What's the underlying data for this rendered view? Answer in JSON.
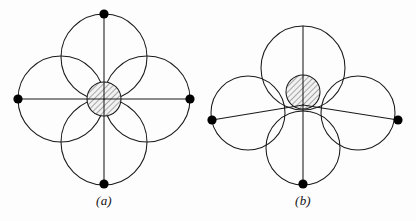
{
  "figure": {
    "background_color": "#fdfdfd",
    "stroke_color": "#1a1a1a",
    "dot_color": "#000000",
    "hatch_color": "#555555",
    "hatch_fill": "#efefef",
    "caption_a": "(a)",
    "caption_b": "(b)"
  },
  "panels": [
    {
      "id": "a",
      "caption": "(a)",
      "center": {
        "x": 104,
        "y": 99
      },
      "center_circle": {
        "cx": 104,
        "cy": 99,
        "r": 17,
        "hatched": true
      },
      "outer_circles": [
        {
          "name": "top-circle",
          "cx": 104,
          "cy": 57,
          "r": 43
        },
        {
          "name": "bottom-circle",
          "cx": 104,
          "cy": 142,
          "r": 43
        },
        {
          "name": "left-circle",
          "cx": 61,
          "cy": 99,
          "r": 43
        },
        {
          "name": "right-circle",
          "cx": 147,
          "cy": 99,
          "r": 43
        }
      ],
      "radial_lines": [
        {
          "name": "line-to-top",
          "x1": 104,
          "y1": 99,
          "x2": 104,
          "y2": 14
        },
        {
          "name": "line-to-bottom",
          "x1": 104,
          "y1": 99,
          "x2": 104,
          "y2": 184
        },
        {
          "name": "line-to-left",
          "x1": 104,
          "y1": 99,
          "x2": 18,
          "y2": 99
        },
        {
          "name": "line-to-right",
          "x1": 104,
          "y1": 99,
          "x2": 190,
          "y2": 99
        }
      ],
      "dots": [
        {
          "name": "dot-top",
          "cx": 104,
          "cy": 14,
          "r": 4.6
        },
        {
          "name": "dot-bottom",
          "cx": 104,
          "cy": 184,
          "r": 4.6
        },
        {
          "name": "dot-left",
          "cx": 18,
          "cy": 99,
          "r": 4.6
        },
        {
          "name": "dot-right",
          "cx": 190,
          "cy": 99,
          "r": 4.6
        }
      ]
    },
    {
      "id": "b",
      "caption": "(b)",
      "center": {
        "x": 303,
        "y": 105
      },
      "center_circle": {
        "cx": 303,
        "cy": 92,
        "r": 17,
        "hatched": true
      },
      "outer_circles": [
        {
          "name": "top-circle",
          "cx": 303,
          "cy": 68,
          "r": 42
        },
        {
          "name": "bottom-circle",
          "cx": 303,
          "cy": 148,
          "r": 37
        },
        {
          "name": "left-circle",
          "cx": 248,
          "cy": 113,
          "r": 37
        },
        {
          "name": "right-circle",
          "cx": 358,
          "cy": 113,
          "r": 37
        }
      ],
      "radial_lines": [
        {
          "name": "line-to-top",
          "x1": 303,
          "y1": 105,
          "x2": 303,
          "y2": 26
        },
        {
          "name": "line-to-bottom",
          "x1": 303,
          "y1": 105,
          "x2": 303,
          "y2": 184
        },
        {
          "name": "line-to-left",
          "x1": 303,
          "y1": 105,
          "x2": 212,
          "y2": 120
        },
        {
          "name": "line-to-right",
          "x1": 303,
          "y1": 105,
          "x2": 398,
          "y2": 120
        }
      ],
      "dots": [
        {
          "name": "dot-bottom",
          "cx": 303,
          "cy": 184,
          "r": 4.6
        },
        {
          "name": "dot-left",
          "cx": 212,
          "cy": 120,
          "r": 4.6
        },
        {
          "name": "dot-right",
          "cx": 398,
          "cy": 120,
          "r": 4.6
        }
      ]
    }
  ]
}
